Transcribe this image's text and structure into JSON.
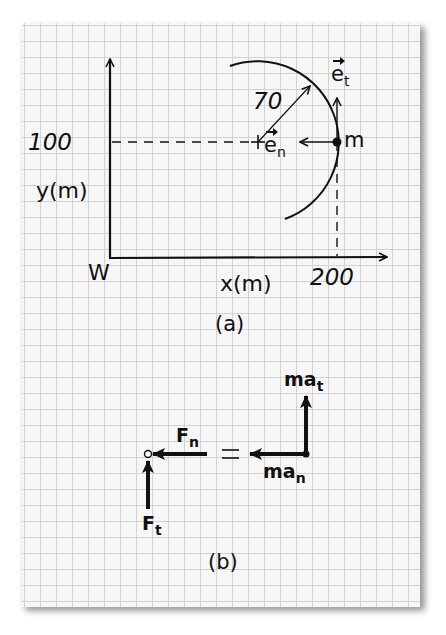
{
  "figure_a": {
    "label": "(a)",
    "y_axis": {
      "label": "y(m)",
      "tick": "100"
    },
    "x_axis": {
      "label": "x(m)",
      "tick": "200"
    },
    "origin_label": "W",
    "radius_label": "70",
    "mass_label": "m",
    "unit_vectors": {
      "tangential": {
        "base": "e",
        "sub": "t"
      },
      "normal": {
        "base": "e",
        "sub": "n"
      }
    }
  },
  "figure_b": {
    "label": "(b)",
    "equals": "=",
    "forces": {
      "normal": {
        "base": "F",
        "sub": "n"
      },
      "tangential": {
        "base": "F",
        "sub": "t"
      }
    },
    "inertial": {
      "tangential": {
        "base": "ma",
        "sub": "t"
      },
      "normal": {
        "base": "ma",
        "sub": "n"
      }
    }
  },
  "colors": {
    "ink": "#111111",
    "grid": "#d2d2d2",
    "paper": "#f6f6f6"
  }
}
